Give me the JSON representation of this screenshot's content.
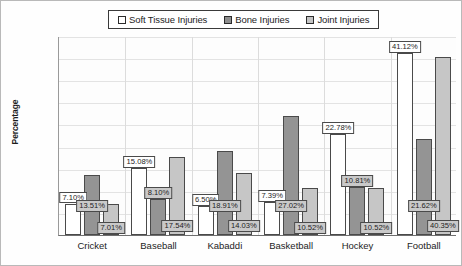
{
  "chart_data": {
    "type": "bar",
    "title": "",
    "xlabel": "",
    "ylabel": "Percentage",
    "ylim": [
      0,
      45
    ],
    "ytick_labels": [
      "0.00%",
      "5.00%",
      "10.00%",
      "15.00%",
      "20.00%",
      "25.00%",
      "30.00%",
      "35.00%",
      "40.00%",
      "45.00%"
    ],
    "ytick_values": [
      0,
      5,
      10,
      15,
      20,
      25,
      30,
      35,
      40,
      45
    ],
    "grid": true,
    "legend_position": "top-center",
    "categories": [
      "Cricket",
      "Baseball",
      "Kabaddi",
      "Basketball",
      "Hockey",
      "Football"
    ],
    "series": [
      {
        "name": "Soft Tissue Injuries",
        "color": "#ffffff",
        "values": [
          7.1,
          15.08,
          6.5,
          7.39,
          22.78,
          41.12
        ],
        "labels": [
          "7.10%",
          "15.08%",
          "6.50%",
          "7.39%",
          "22.78%",
          "41.12%"
        ],
        "label_style": [
          "white",
          "white",
          "white",
          "white",
          "white",
          "white"
        ]
      },
      {
        "name": "Bone Injuries",
        "color": "#949494",
        "values": [
          13.51,
          8.1,
          18.91,
          27.02,
          10.81,
          21.62
        ],
        "labels": [
          "13.51%",
          "8.10%",
          "18.91%",
          "27.02%",
          "10.81%",
          "21.62%"
        ],
        "label_style": [
          "grey",
          "grey",
          "grey",
          "grey",
          "grey",
          "grey"
        ]
      },
      {
        "name": "Joint Injuries",
        "color": "#c6c6c6",
        "values": [
          7.01,
          17.54,
          14.03,
          10.52,
          10.52,
          40.35
        ],
        "labels": [
          "7.01%",
          "17.54%",
          "14.03%",
          "10.52%",
          "10.52%",
          "40.35%"
        ],
        "label_style": [
          "grey",
          "grey",
          "grey",
          "grey",
          "grey",
          "grey"
        ]
      }
    ]
  }
}
